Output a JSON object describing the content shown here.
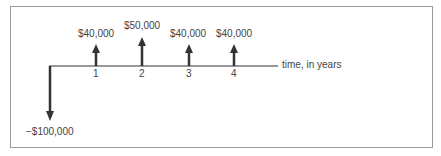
{
  "diagram": {
    "type": "cash-flow-timeline",
    "axis_label": "time, in years",
    "initial": {
      "year": 0,
      "amount": -100000,
      "label": "−$100,000",
      "direction": "down"
    },
    "flows": [
      {
        "year": 1,
        "tick": "1",
        "amount": 40000,
        "label": "$40,000",
        "direction": "up"
      },
      {
        "year": 2,
        "tick": "2",
        "amount": 50000,
        "label": "$50,000",
        "direction": "up"
      },
      {
        "year": 3,
        "tick": "3",
        "amount": 40000,
        "label": "$40,000",
        "direction": "up"
      },
      {
        "year": 4,
        "tick": "4",
        "amount": 40000,
        "label": "$40,000",
        "direction": "up"
      }
    ],
    "colors": {
      "line": "#333333",
      "arrow": "#333333",
      "border": "#9a9a9a",
      "text": "#444444"
    }
  }
}
